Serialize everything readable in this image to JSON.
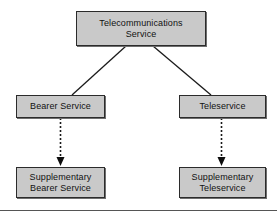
{
  "diagram": {
    "title_text_top": "Telecommunications\nService",
    "background_color": "#ffffff",
    "node_fill_color": "#c9c9c9",
    "node_border_color": "#2b2b2b",
    "edge_color": "#1a1a1a",
    "nodes": [
      {
        "id": "telecommunications-service",
        "label": "Telecommunications\nService"
      },
      {
        "id": "bearer-service",
        "label": "Bearer Service"
      },
      {
        "id": "teleservice",
        "label": "Teleservice"
      },
      {
        "id": "supplementary-bearer-service",
        "label": "Supplementary\nBearer Service"
      },
      {
        "id": "supplementary-teleservice",
        "label": "Supplementary\nTeleservice"
      }
    ],
    "edges": [
      {
        "id": "edge-telecom-to-bearer",
        "from": "telecommunications-service",
        "to": "bearer-service",
        "style": "solid",
        "arrow": "none"
      },
      {
        "id": "edge-telecom-to-teleservice",
        "from": "telecommunications-service",
        "to": "teleservice",
        "style": "solid",
        "arrow": "none"
      },
      {
        "id": "edge-bearer-to-supplementary-bearer",
        "from": "bearer-service",
        "to": "supplementary-bearer-service",
        "style": "dashed",
        "arrow": "filled-triangle"
      },
      {
        "id": "edge-teleservice-to-supplementary-teleservice",
        "from": "teleservice",
        "to": "supplementary-teleservice",
        "style": "dashed",
        "arrow": "filled-triangle"
      }
    ]
  }
}
